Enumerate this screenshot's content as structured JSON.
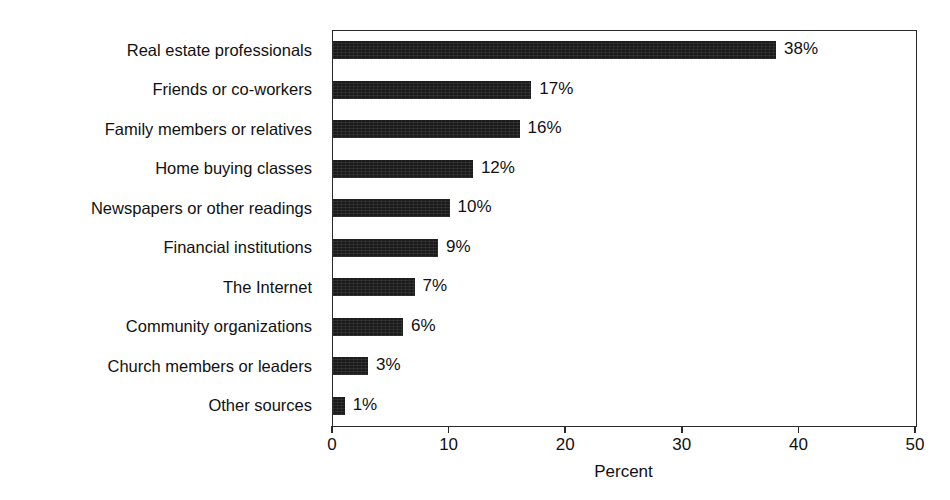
{
  "chart_data": {
    "type": "bar",
    "orientation": "horizontal",
    "title": "",
    "subtitle": "",
    "xlabel": "Percent",
    "ylabel": "",
    "xlim": [
      0,
      50
    ],
    "xticks": [
      0,
      10,
      20,
      30,
      40,
      50
    ],
    "xtick_labels": [
      "0",
      "10",
      "20",
      "30",
      "40",
      "50"
    ],
    "grid": false,
    "legend": false,
    "bar_color": "#1b1b1b",
    "frame_color": "#2a2a2a",
    "background": "#ffffff",
    "categories": [
      "Real estate professionals",
      "Friends or co-workers",
      "Family members or relatives",
      "Home buying classes",
      "Newspapers or other readings",
      "Financial institutions",
      "The Internet",
      "Community organizations",
      "Church members or leaders",
      "Other sources"
    ],
    "values": [
      38,
      17,
      16,
      12,
      10,
      9,
      7,
      6,
      3,
      1
    ],
    "value_labels": [
      "38%",
      "17%",
      "16%",
      "12%",
      "10%",
      "9%",
      "7%",
      "6%",
      "3%",
      "1%"
    ]
  }
}
